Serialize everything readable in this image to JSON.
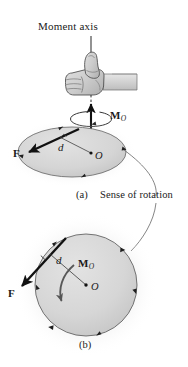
{
  "figure": {
    "title": "Moment axis",
    "sense_label": "Sense of rotation",
    "panel_a_label": "(a)",
    "panel_b_label": "(b)",
    "colors": {
      "ink": "#1a1a1a",
      "disk_fill": "#d6d6d6",
      "disk_edge": "#5a5a5a",
      "hand_fill": "#cfcfcf",
      "hand_edge": "#4a4a4a",
      "arrow_dark": "#111111",
      "leader_line": "#6b6b6b",
      "background": "#ffffff"
    },
    "panel_a": {
      "label": "(a)",
      "moment_vector_label": "M",
      "moment_vector_sub": "O",
      "force_label": "F",
      "distance_label": "d",
      "origin_label": "O",
      "axis_label": "Moment axis",
      "icons": {
        "hand": "thumbs-up-hand-icon",
        "axis": "dashed-axis-icon",
        "curl": "curl-arrow-icon",
        "right_angle": "right-angle-mark-icon"
      }
    },
    "panel_b": {
      "label": "(b)",
      "moment_label": "M",
      "moment_sub": "O",
      "force_label": "F",
      "distance_label": "d",
      "origin_label": "O",
      "icons": {
        "curved_moment_arrow": "curved-moment-arrow-icon",
        "right_angle": "right-angle-mark-icon",
        "rotation_arrows": "rotation-direction-arrows-icon"
      }
    }
  }
}
